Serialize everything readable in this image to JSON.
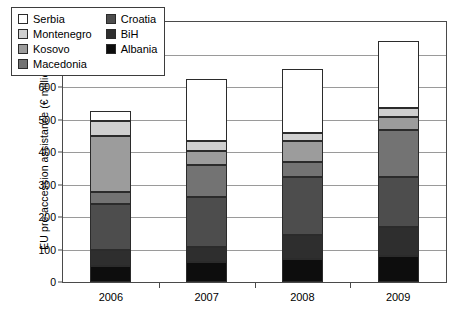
{
  "chart_data": {
    "type": "bar",
    "stacked": true,
    "title": "",
    "xlabel": "",
    "ylabel": "EU pre-accession assistance (€ million)",
    "categories": [
      "2006",
      "2007",
      "2008",
      "2009"
    ],
    "ylim": [
      0,
      800
    ],
    "ytick_values": [
      0,
      100,
      200,
      300,
      400,
      500,
      600,
      700,
      800
    ],
    "ytick_labels": [
      "0",
      "100",
      "200",
      "300",
      "400",
      "500",
      "600",
      "700",
      "800"
    ],
    "grid": true,
    "legend_position": "upper-left-inside",
    "stack_order_bottom_to_top": [
      "Albania",
      "BiH",
      "Croatia",
      "Macedonia",
      "Kosovo",
      "Montenegro",
      "Serbia"
    ],
    "series": [
      {
        "name": "Albania",
        "color": "#0d0d0d",
        "values": [
          48,
          61,
          71,
          81
        ]
      },
      {
        "name": "BiH",
        "color": "#2e2e2e",
        "values": [
          51,
          47,
          74,
          89
        ]
      },
      {
        "name": "Croatia",
        "color": "#4d4d4d",
        "values": [
          141,
          154,
          177,
          152
        ]
      },
      {
        "name": "Macedonia",
        "color": "#737373",
        "values": [
          38,
          99,
          48,
          146
        ]
      },
      {
        "name": "Kosovo",
        "color": "#9c9c9c",
        "values": [
          171,
          43,
          63,
          40
        ]
      },
      {
        "name": "Montenegro",
        "color": "#cfcfcf",
        "values": [
          47,
          31,
          25,
          28
        ]
      },
      {
        "name": "Serbia",
        "color": "#ffffff",
        "values": [
          31,
          189,
          196,
          205
        ]
      }
    ],
    "totals": [
      527,
      624,
      654,
      741
    ]
  },
  "legend": {
    "column_left": [
      {
        "label": "Serbia",
        "color": "#ffffff"
      },
      {
        "label": "Montenegro",
        "color": "#cfcfcf"
      },
      {
        "label": "Kosovo",
        "color": "#9c9c9c"
      },
      {
        "label": "Macedonia",
        "color": "#737373"
      }
    ],
    "column_right": [
      {
        "label": "Croatia",
        "color": "#4d4d4d"
      },
      {
        "label": "BiH",
        "color": "#2e2e2e"
      },
      {
        "label": "Albania",
        "color": "#0d0d0d"
      }
    ]
  },
  "axis": {
    "y_title": "EU pre-accession assistance (€ million)"
  }
}
